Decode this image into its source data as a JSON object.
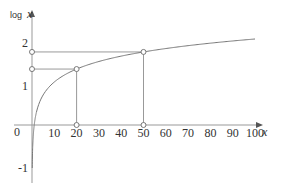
{
  "chart_data": {
    "type": "line",
    "title": "",
    "xlabel": "x",
    "ylabel": "log x",
    "ylabel_prefix": "log",
    "ylabel_var": "x",
    "xlim": [
      0,
      100
    ],
    "ylim": [
      -1,
      2
    ],
    "origin_label": "0",
    "x_ticks": [
      10,
      20,
      30,
      40,
      50,
      60,
      70,
      80,
      90,
      100
    ],
    "x_tick_labels": [
      "10",
      "20",
      "30",
      "40",
      "50",
      "60",
      "70",
      "80",
      "90",
      "100"
    ],
    "y_ticks": [
      -1,
      1,
      2
    ],
    "y_tick_labels": [
      "-1",
      "1",
      "2"
    ],
    "grid": false,
    "series": [
      {
        "name": "log x",
        "function": "log10(x)",
        "x": [
          0.1,
          1,
          2,
          5,
          10,
          20,
          50,
          100
        ],
        "values": [
          -1,
          0,
          0.301,
          0.699,
          1,
          1.301,
          1.699,
          2
        ]
      }
    ],
    "annotations": [
      {
        "type": "marker",
        "x": 20,
        "y": 1.301,
        "guides": true
      },
      {
        "type": "marker",
        "x": 50,
        "y": 1.699,
        "guides": true
      }
    ]
  }
}
